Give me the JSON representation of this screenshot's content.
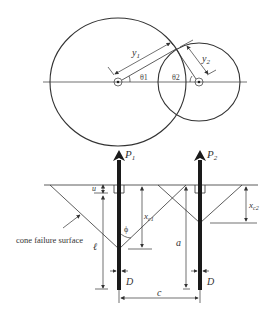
{
  "top_view": {
    "circle1_label_radius": "y",
    "circle1_label_sub": "1",
    "circle2_label_radius": "y",
    "circle2_label_sub": "2",
    "theta1": "θ1",
    "theta2": "θ2"
  },
  "side_view": {
    "load1": "P",
    "load1_sub": "1",
    "load2": "P",
    "load2_sub": "2",
    "u_label": "u",
    "xc1_label": "x",
    "xc1_sub": "c1",
    "xc2_label": "x",
    "xc2_sub": "c2",
    "phi_label": "ϕ",
    "ell_label": "ℓ",
    "a_label": "a",
    "c_label": "c",
    "d1_label": "D",
    "d2_label": "D",
    "cone_label": "cone failure surface"
  },
  "colors": {
    "line": "#333333",
    "pile": "#1a1a1a",
    "background": "#ffffff"
  }
}
